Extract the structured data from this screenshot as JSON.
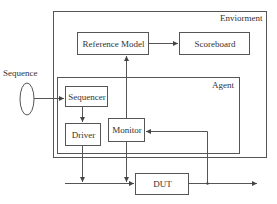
{
  "diagram": {
    "type": "block-diagram",
    "containers": {
      "environment": {
        "label": "Enviorment"
      },
      "agent": {
        "label": "Agent"
      }
    },
    "external": {
      "sequence": {
        "label": "Sequence"
      }
    },
    "blocks": {
      "reference_model": {
        "label": "Reference Model"
      },
      "scoreboard": {
        "label": "Scoreboard"
      },
      "sequencer": {
        "label": "Sequencer"
      },
      "driver": {
        "label": "Driver"
      },
      "monitor": {
        "label": "Monitor"
      },
      "dut": {
        "label": "DUT"
      }
    },
    "connections": [
      {
        "from": "Sequence",
        "to": "Sequencer"
      },
      {
        "from": "Sequencer",
        "to": "Driver"
      },
      {
        "from": "Driver",
        "to": "DUT input bus"
      },
      {
        "from": "Monitor",
        "to": "DUT input bus"
      },
      {
        "from": "Monitor",
        "to": "Reference Model"
      },
      {
        "from": "Reference Model",
        "to": "Scoreboard"
      },
      {
        "from": "DUT output",
        "to": "Monitor"
      },
      {
        "from": "DUT",
        "to": "output"
      }
    ],
    "colors": {
      "stroke": "#555555",
      "text": "#333333",
      "background": "#ffffff"
    }
  }
}
